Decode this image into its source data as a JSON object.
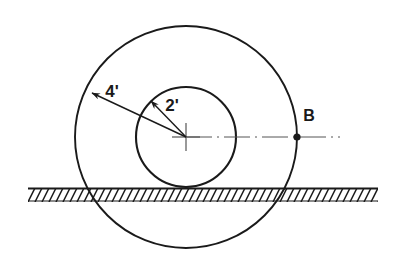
{
  "figure": {
    "type": "engineering-diagram",
    "background_color": "#ffffff",
    "line_color": "#1a1a1a",
    "thin_line_color": "#555555"
  },
  "canvas": {
    "width": 394,
    "height": 260
  },
  "geometry": {
    "center": {
      "x": 186,
      "y": 137
    },
    "outer_circle": {
      "cx": 186,
      "cy": 137,
      "r": 111
    },
    "inner_circle": {
      "cx": 186,
      "cy": 137,
      "r": 50
    },
    "ground_line": {
      "y": 188,
      "x_start": 28,
      "x_end": 378,
      "hatch_depth": 13,
      "hatch_spacing": 7
    },
    "point_b": {
      "x": 297,
      "y": 137,
      "dot_radius": 3.6
    },
    "centerline": {
      "x_start": 186,
      "y": 137,
      "x_end": 340
    },
    "leader_outer": {
      "x1": 186,
      "y1": 137,
      "x2": 92,
      "y2": 93
    },
    "leader_inner": {
      "x1": 186,
      "y1": 137,
      "x2": 151,
      "y2": 101
    },
    "center_mark": {
      "half_len": 14
    }
  },
  "labels": {
    "outer_radius": "4'",
    "inner_radius": "2'",
    "point_b": "B"
  },
  "label_positions": {
    "outer_radius": {
      "x": 112,
      "y": 97
    },
    "inner_radius": {
      "x": 172,
      "y": 111
    },
    "point_b": {
      "x": 309,
      "y": 121
    }
  }
}
